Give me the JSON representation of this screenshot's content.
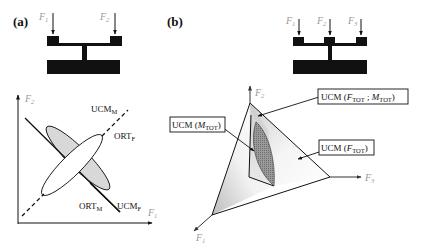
{
  "panels": {
    "a": {
      "label": "(a)",
      "apparatus": {
        "forces": [
          "F1",
          "F2"
        ],
        "force_labels": [
          {
            "main": "F",
            "sub": "1"
          },
          {
            "main": "F",
            "sub": "2"
          }
        ]
      },
      "plot": {
        "y_axis": {
          "main": "F",
          "sub": "2"
        },
        "x_axis": {
          "main": "F",
          "sub": "1"
        },
        "lines": [
          {
            "name": "UCM_F",
            "style": "solid",
            "direction": "negative-slope"
          },
          {
            "name": "UCM_M",
            "style": "dashed",
            "direction": "positive-slope"
          }
        ],
        "labels": {
          "ucm_m": {
            "main": "UCM",
            "sub": "M"
          },
          "ort_f": {
            "main": "ORT",
            "sub": "F"
          },
          "ort_m": {
            "main": "ORT",
            "sub": "M"
          },
          "ucm_f": {
            "main": "UCM",
            "sub": "F"
          }
        },
        "ellipses": [
          {
            "name": "shaded-ellipse",
            "orientation": "along UCM_F",
            "fill": "#d9d9d9"
          },
          {
            "name": "white-ellipse",
            "orientation": "along UCM_M",
            "fill": "#ffffff"
          }
        ]
      }
    },
    "b": {
      "label": "(b)",
      "apparatus": {
        "forces": [
          "F1",
          "F2",
          "F3"
        ],
        "force_labels": [
          {
            "main": "F",
            "sub": "1"
          },
          {
            "main": "F",
            "sub": "2"
          },
          {
            "main": "F",
            "sub": "3"
          }
        ]
      },
      "plot3d": {
        "axes": [
          {
            "main": "F",
            "sub": "1"
          },
          {
            "main": "F",
            "sub": "2"
          },
          {
            "main": "F",
            "sub": "3"
          }
        ],
        "annotations": {
          "ucm_ftot_mtot": {
            "prefix": "UCM (",
            "f": "F",
            "fsub": "TOT",
            "sep": " ; ",
            "m": "M",
            "msub": "TOT",
            "suffix": ")"
          },
          "ucm_mtot": {
            "prefix": "UCM (",
            "m": "M",
            "msub": "TOT",
            "suffix": ")"
          },
          "ucm_ftot": {
            "prefix": "UCM (",
            "f": "F",
            "fsub": "TOT",
            "suffix": ")"
          }
        }
      }
    }
  },
  "colors": {
    "ink": "#111111",
    "axis_label": "#999999",
    "shade": "#d4d4d4",
    "dark_shade": "#8a8a8a"
  }
}
